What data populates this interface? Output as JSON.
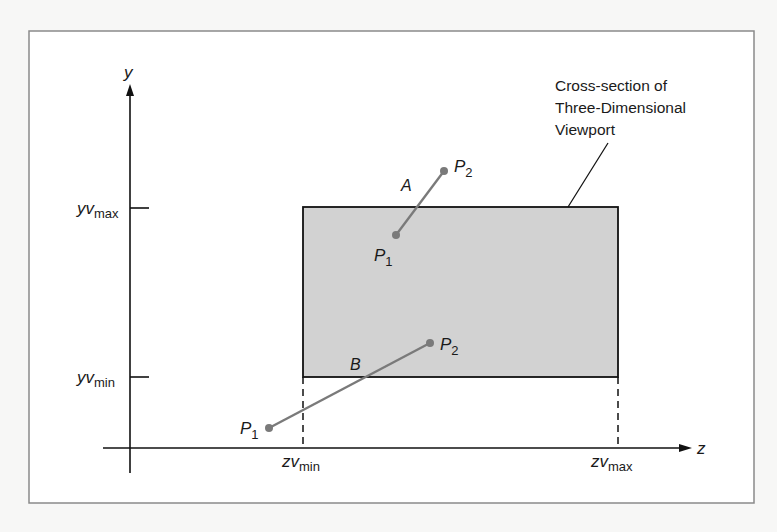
{
  "figure": {
    "axes": {
      "y_label": "y",
      "z_label": "z"
    },
    "ticks": {
      "yv_max": {
        "base": "yv",
        "sub": "max"
      },
      "yv_min": {
        "base": "yv",
        "sub": "min"
      },
      "zv_min": {
        "base": "zv",
        "sub": "min"
      },
      "zv_max": {
        "base": "zv",
        "sub": "max"
      }
    },
    "viewport": {
      "caption_lines": [
        "Cross-section of",
        "Three-Dimensional",
        "Viewport"
      ],
      "fill_color": "#d2d2d2"
    },
    "segments": [
      {
        "name": "A",
        "p1": {
          "base": "P",
          "sub": "1"
        },
        "p2": {
          "base": "P",
          "sub": "2"
        }
      },
      {
        "name": "B",
        "p1": {
          "base": "P",
          "sub": "1"
        },
        "p2": {
          "base": "P",
          "sub": "2"
        }
      }
    ],
    "colors": {
      "line": "#111111",
      "segment": "#7a7a7a",
      "frame": "#8a8a8a"
    }
  }
}
